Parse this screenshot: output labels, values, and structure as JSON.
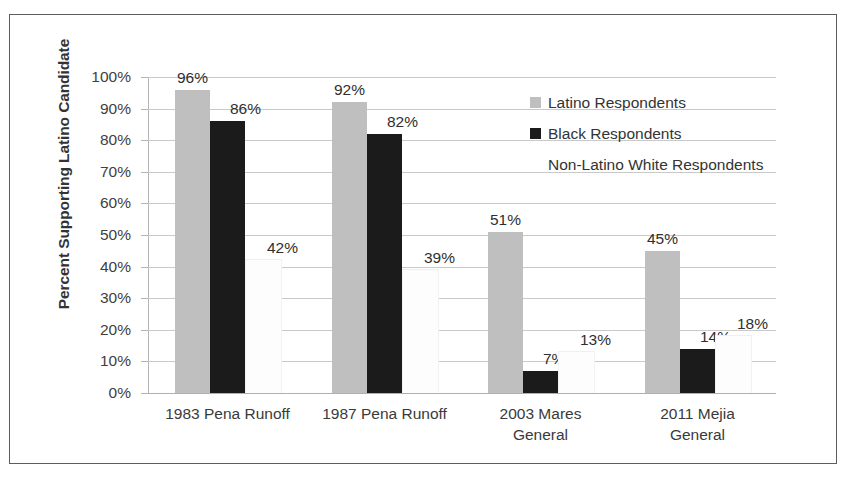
{
  "chart_data": {
    "type": "bar",
    "title": "",
    "subtitle": "",
    "xlabel": "",
    "ylabel": "Percent Supporting Latino Candidate",
    "ylim": [
      0,
      100
    ],
    "grid": true,
    "legend_position": "inside-upper-right",
    "value_suffix": "%",
    "categories": [
      "1983 Pena Runoff",
      "1987 Pena Runoff",
      "2003 Mares General",
      "2011 Mejia General"
    ],
    "category_lines": [
      [
        "1983 Pena Runoff"
      ],
      [
        "1987 Pena Runoff"
      ],
      [
        "2003 Mares",
        "General"
      ],
      [
        "2011 Mejia",
        "General"
      ]
    ],
    "series": [
      {
        "name": "Latino Respondents",
        "color": "#bfbfbf",
        "values": [
          96,
          92,
          51,
          45
        ],
        "labels": [
          "96%",
          "92%",
          "51%",
          "45%"
        ]
      },
      {
        "name": "Black Respondents",
        "color": "#1b1b1b",
        "values": [
          86,
          82,
          7,
          14
        ],
        "labels": [
          "86%",
          "82%",
          "7%",
          "14%"
        ]
      },
      {
        "name": "Non-Latino White Respondents",
        "color": "#ffffff",
        "values": [
          42,
          39,
          13,
          18
        ],
        "labels": [
          "42%",
          "39%",
          "13%",
          "18%"
        ]
      }
    ],
    "y_ticks": [
      "0%",
      "10%",
      "20%",
      "30%",
      "40%",
      "50%",
      "60%",
      "70%",
      "80%",
      "90%",
      "100%"
    ],
    "y_tick_values": [
      0,
      10,
      20,
      30,
      40,
      50,
      60,
      70,
      80,
      90,
      100
    ]
  },
  "legend": {
    "items": [
      {
        "label": "Latino Respondents",
        "swatch": "latino"
      },
      {
        "label": "Black Respondents",
        "swatch": "black"
      },
      {
        "label": "Non-Latino White Respondents",
        "swatch": "white"
      }
    ]
  }
}
